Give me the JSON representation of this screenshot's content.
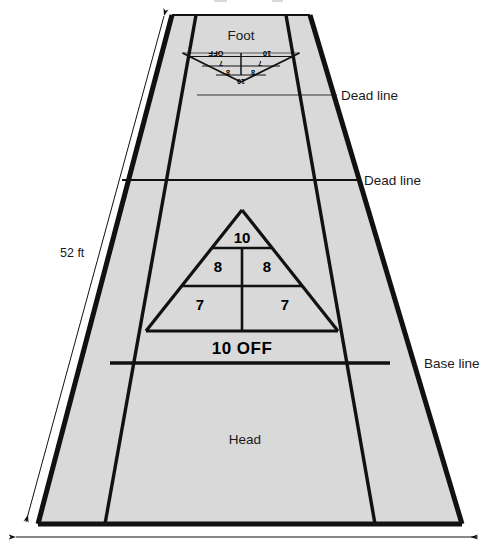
{
  "diagram": {
    "fill_color": "#d9d9d9",
    "line_color": "#111111",
    "thin_line_color": "#555555",
    "background_color": "#ffffff"
  },
  "dimensions": {
    "length_label": "52 ft",
    "width_label": ""
  },
  "zones": {
    "foot": "Foot",
    "head": "Head"
  },
  "lines": {
    "dead_line_far": "Dead line",
    "dead_line_near": "Dead line",
    "base_line": "Base line"
  },
  "scoring_near": {
    "apex": "10",
    "mid_left": "8",
    "mid_right": "8",
    "low_left": "7",
    "low_right": "7",
    "off_zone": "10   OFF"
  },
  "scoring_far": {
    "apex": "10",
    "mid_left": "8",
    "mid_right": "8",
    "low_left": "7",
    "low_right": "7",
    "off_left": "10",
    "off_right": "OFF"
  }
}
